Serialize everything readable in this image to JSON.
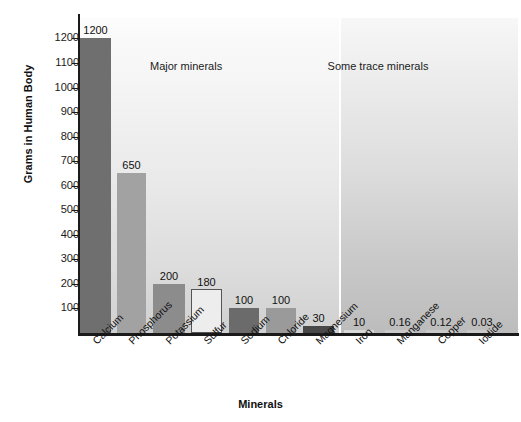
{
  "chart_data": {
    "type": "bar",
    "title": "",
    "xlabel": "Minerals",
    "ylabel": "Grams in Human Body",
    "ylim": [
      0,
      1250
    ],
    "grid": false,
    "legend": "none",
    "categories": [
      "Calcium",
      "Phosphorus",
      "Potassium",
      "Sulfur",
      "Sodium",
      "Chloride",
      "Magnesium",
      "Iron",
      "Manganese",
      "Copper",
      "Iodide"
    ],
    "values": [
      1200,
      650,
      200,
      180,
      100,
      100,
      30,
      10,
      0.16,
      0.12,
      0.03
    ],
    "value_labels": [
      "1200",
      "650",
      "200",
      "180",
      "100",
      "100",
      "30",
      "10",
      "0.16",
      "0.12",
      "0.03"
    ],
    "bar_colors": [
      "#6f6f6f",
      "#a2a2a2",
      "#8c8c8c",
      "#ededed",
      "#6b6b6b",
      "#9a9a9a",
      "#484848",
      "#d8d8d8",
      "#c9c9c9",
      "#c9c9c9",
      "#c9c9c9"
    ],
    "ytick_labels": [
      "1200",
      "1100",
      "1000",
      "900",
      "800",
      "700",
      "600",
      "500",
      "400",
      "300",
      "200",
      "100"
    ],
    "yticks": [
      1200,
      1100,
      1000,
      900,
      800,
      700,
      600,
      500,
      400,
      300,
      200,
      100
    ],
    "annotations": [
      {
        "name": "major-minerals-label",
        "text": "Major minerals"
      },
      {
        "name": "trace-minerals-label",
        "text": "Some trace minerals"
      }
    ],
    "groups": [
      {
        "label": "Major minerals",
        "categories": [
          "Calcium",
          "Phosphorus",
          "Potassium",
          "Sulfur",
          "Sodium",
          "Chloride",
          "Magnesium"
        ]
      },
      {
        "label": "Some trace minerals",
        "categories": [
          "Iron",
          "Manganese",
          "Copper",
          "Iodide"
        ]
      }
    ]
  }
}
